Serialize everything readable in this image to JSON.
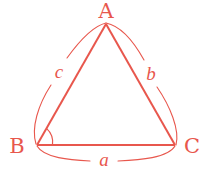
{
  "diagram": {
    "type": "triangle",
    "color": "#e8574d",
    "vertices": {
      "A": {
        "label": "A"
      },
      "B": {
        "label": "B"
      },
      "C": {
        "label": "C"
      }
    },
    "sides": {
      "a": {
        "label": "a",
        "between": [
          "B",
          "C"
        ]
      },
      "b": {
        "label": "b",
        "between": [
          "A",
          "C"
        ]
      },
      "c": {
        "label": "c",
        "between": [
          "A",
          "B"
        ]
      }
    },
    "angle_marks": [
      "B"
    ]
  }
}
